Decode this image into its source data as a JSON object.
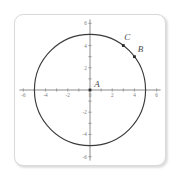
{
  "figure": {
    "panel_name": "coordinate-plane-panel",
    "background_color": "#ffffff",
    "border_color": "#d9d9d9"
  },
  "chart_data": {
    "type": "scatter",
    "title": "",
    "subtitle": "",
    "xlabel": "",
    "ylabel": "",
    "xlim": [
      -6,
      6
    ],
    "ylim": [
      -6,
      6
    ],
    "grid": false,
    "legend": "none",
    "axis_color": "#8c8c8c",
    "curve_color": "#3a3a3a",
    "point_color": "#2b2b2b",
    "x_ticks": [
      -6,
      -5,
      -4,
      -3,
      -2,
      -1,
      0,
      1,
      2,
      3,
      4,
      5,
      6
    ],
    "y_ticks": [
      -6,
      -5,
      -4,
      -3,
      -2,
      -1,
      0,
      1,
      2,
      3,
      4,
      5,
      6
    ],
    "x_tick_labels": [
      {
        "value": -6,
        "text": "-6"
      },
      {
        "value": -4,
        "text": "-4"
      },
      {
        "value": -2,
        "text": "-2"
      },
      {
        "value": 0,
        "text": "0"
      },
      {
        "value": 2,
        "text": "2"
      },
      {
        "value": 4,
        "text": "4"
      },
      {
        "value": 6,
        "text": "6"
      }
    ],
    "y_tick_labels": [
      {
        "value": 6,
        "text": "6"
      },
      {
        "value": 4,
        "text": "4"
      },
      {
        "value": 2,
        "text": "2"
      },
      {
        "value": -2,
        "text": "-2"
      },
      {
        "value": -4,
        "text": "-4"
      },
      {
        "value": -6,
        "text": "-6"
      }
    ],
    "shapes": [
      {
        "kind": "circle",
        "center": [
          0,
          0
        ],
        "radius": 5,
        "stroke": "#3a3a3a",
        "fill": "none"
      }
    ],
    "points": [
      {
        "label": "A",
        "x": 0,
        "y": 0,
        "label_dx": 7,
        "label_dy": -3
      },
      {
        "label": "B",
        "x": 4,
        "y": 3,
        "label_dx": 6,
        "label_dy": -5
      },
      {
        "label": "C",
        "x": 3,
        "y": 4,
        "label_dx": 4,
        "label_dy": -6
      }
    ]
  }
}
